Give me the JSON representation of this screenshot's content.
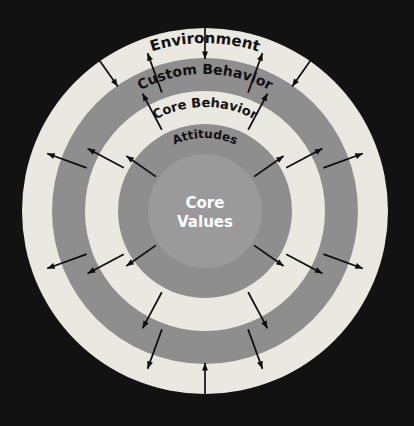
{
  "diagram": {
    "title_present": false,
    "background_color": "#121212",
    "center": {
      "x": 205,
      "y": 211
    },
    "rings": [
      {
        "name": "environment",
        "label": "Environment",
        "outer_radius": 183,
        "inner_radius": 153,
        "fill": "#e9e9e1",
        "label_color": "#111111",
        "label_font_size": 15,
        "label_radius": 168,
        "label_curved": true
      },
      {
        "name": "custom-behavior",
        "label": "Custom Behavior",
        "outer_radius": 153,
        "inner_radius": 120,
        "fill": "#8e8e8e",
        "label_color": "#111111",
        "label_font_size": 14,
        "label_radius": 137,
        "label_curved": true
      },
      {
        "name": "core-behavior",
        "label": "Core Behavior",
        "outer_radius": 120,
        "inner_radius": 87,
        "fill": "#e9e9e1",
        "label_color": "#111111",
        "label_font_size": 13,
        "label_radius": 104,
        "label_curved": true
      },
      {
        "name": "attitudes",
        "label": "Attitudes",
        "outer_radius": 87,
        "inner_radius": 57,
        "fill": "#8e8e8e",
        "label_color": "#111111",
        "label_font_size": 12,
        "label_radius": 73,
        "label_curved": true
      },
      {
        "name": "core-values",
        "label": "Core Values",
        "outer_radius": 57,
        "inner_radius": 0,
        "fill": "#9a9a9a",
        "label_color": "#ffffff",
        "label_font_size": 14,
        "label_curved": false
      }
    ],
    "center_label": {
      "line1": "Core",
      "line2": "Values",
      "color": "#ffffff"
    },
    "arrows": {
      "color": "#0d0d0d",
      "description": "radial double-ended arrows radiating outward from the core across the rings",
      "groups": [
        {
          "name": "inner-arrows",
          "r_start": 60,
          "r_end": 96,
          "direction": "outward",
          "angles": [
            -125,
            -55,
            55,
            125
          ]
        },
        {
          "name": "mid-arrows",
          "r_start": 92,
          "r_end": 133,
          "direction": "outward",
          "angles": [
            -152,
            -118,
            -62,
            -28,
            28,
            62,
            118,
            152
          ]
        },
        {
          "name": "outer-arrows",
          "r_start": 126,
          "r_end": 168,
          "direction": "outward",
          "angles": [
            -160,
            -110,
            -70,
            -20,
            20,
            70,
            110,
            160
          ]
        },
        {
          "name": "edge-arrows-inward",
          "r_start": 186,
          "r_end": 152,
          "direction": "inward",
          "angles": [
            -180,
            -35,
            0,
            35
          ]
        }
      ]
    }
  }
}
